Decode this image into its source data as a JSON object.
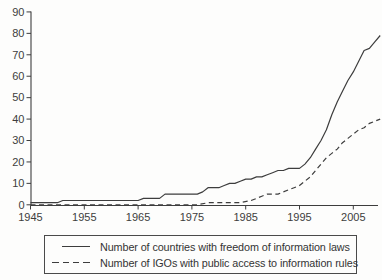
{
  "figure": {
    "background": "#fdfdfc",
    "ink_color": "#3d3d3d"
  },
  "chart_data": {
    "type": "line",
    "title": "",
    "xlabel": "",
    "ylabel": "",
    "grid": false,
    "legend_position": "bottom-boxed",
    "x_axis": {
      "min": 1945,
      "max": 2010,
      "tick_years": [
        1945,
        1955,
        1965,
        1975,
        1985,
        1995,
        2005
      ],
      "tick_labels": [
        "1945",
        "1955",
        "1965",
        "1975",
        "1985",
        "1995",
        "2005"
      ]
    },
    "y_axis": {
      "min": 0,
      "max": 90,
      "tick_values": [
        0,
        10,
        20,
        30,
        40,
        50,
        60,
        70,
        80,
        90
      ],
      "tick_labels": [
        "0",
        "10",
        "20",
        "30",
        "40",
        "50",
        "60",
        "70",
        "80",
        "90"
      ]
    },
    "series": [
      {
        "name": "Number of countries with freedom of information laws",
        "style": "solid",
        "points": [
          [
            1945,
            1
          ],
          [
            1950,
            1
          ],
          [
            1951,
            2
          ],
          [
            1965,
            2
          ],
          [
            1966,
            3
          ],
          [
            1969,
            3
          ],
          [
            1970,
            5
          ],
          [
            1976,
            5
          ],
          [
            1977,
            6
          ],
          [
            1978,
            8
          ],
          [
            1980,
            8
          ],
          [
            1981,
            9
          ],
          [
            1982,
            10
          ],
          [
            1983,
            10
          ],
          [
            1984,
            11
          ],
          [
            1985,
            12
          ],
          [
            1986,
            12
          ],
          [
            1987,
            13
          ],
          [
            1988,
            13
          ],
          [
            1989,
            14
          ],
          [
            1990,
            15
          ],
          [
            1991,
            16
          ],
          [
            1992,
            16
          ],
          [
            1993,
            17
          ],
          [
            1994,
            17
          ],
          [
            1995,
            17
          ],
          [
            1996,
            19
          ],
          [
            1997,
            22
          ],
          [
            1998,
            26
          ],
          [
            1999,
            30
          ],
          [
            2000,
            35
          ],
          [
            2001,
            42
          ],
          [
            2002,
            48
          ],
          [
            2003,
            53
          ],
          [
            2004,
            58
          ],
          [
            2005,
            62
          ],
          [
            2006,
            67
          ],
          [
            2007,
            72
          ],
          [
            2008,
            73
          ],
          [
            2009,
            76
          ],
          [
            2010,
            79
          ]
        ]
      },
      {
        "name": "Number of IGOs with public access to information rules",
        "style": "dashed",
        "points": [
          [
            1945,
            0
          ],
          [
            1976,
            0
          ],
          [
            1978,
            1
          ],
          [
            1984,
            1
          ],
          [
            1986,
            2
          ],
          [
            1987,
            3
          ],
          [
            1988,
            4
          ],
          [
            1989,
            5
          ],
          [
            1991,
            5
          ],
          [
            1992,
            6
          ],
          [
            1993,
            7
          ],
          [
            1994,
            8
          ],
          [
            1995,
            9
          ],
          [
            1996,
            11
          ],
          [
            1997,
            13
          ],
          [
            1998,
            16
          ],
          [
            1999,
            19
          ],
          [
            2000,
            22
          ],
          [
            2001,
            24
          ],
          [
            2002,
            26
          ],
          [
            2003,
            29
          ],
          [
            2004,
            31
          ],
          [
            2005,
            33
          ],
          [
            2006,
            35
          ],
          [
            2007,
            36
          ],
          [
            2008,
            38
          ],
          [
            2009,
            39
          ],
          [
            2010,
            40
          ]
        ]
      }
    ]
  },
  "legend": {
    "items": [
      {
        "label": "Number of countries with freedom of information laws",
        "line_style": "solid"
      },
      {
        "label": "Number of IGOs with public access to information rules",
        "line_style": "dashed"
      }
    ]
  }
}
